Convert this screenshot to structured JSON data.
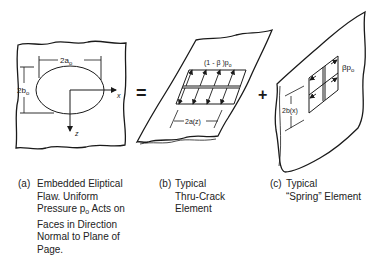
{
  "panels": {
    "a": {
      "dim_width": "2a",
      "dim_width_sub": "o",
      "dim_height": "2b",
      "dim_height_sub": "o",
      "axis_x": "x",
      "axis_z": "z"
    },
    "operators": {
      "equals": "=",
      "plus": "+"
    },
    "b": {
      "pressure_label": "(1 - β )p",
      "pressure_sub": "o",
      "dim_width": "2a(z)"
    },
    "c": {
      "pressure_label": "βp",
      "pressure_sub": "o",
      "dim_height": "2b(x)"
    }
  },
  "captions": {
    "a": {
      "tag": "(a)",
      "lines": [
        "Embedded Eliptical",
        "Flaw. Uniform",
        "Pressure p",
        "Acts on",
        "Faces in Direction",
        "Normal to Plane of",
        "Page."
      ],
      "sub": "o"
    },
    "b": {
      "tag": "(b)",
      "lines": [
        "Typical",
        "Thru-Crack",
        "Element"
      ]
    },
    "c": {
      "tag": "(c)",
      "lines": [
        "Typical",
        "“Spring” Element"
      ]
    }
  }
}
